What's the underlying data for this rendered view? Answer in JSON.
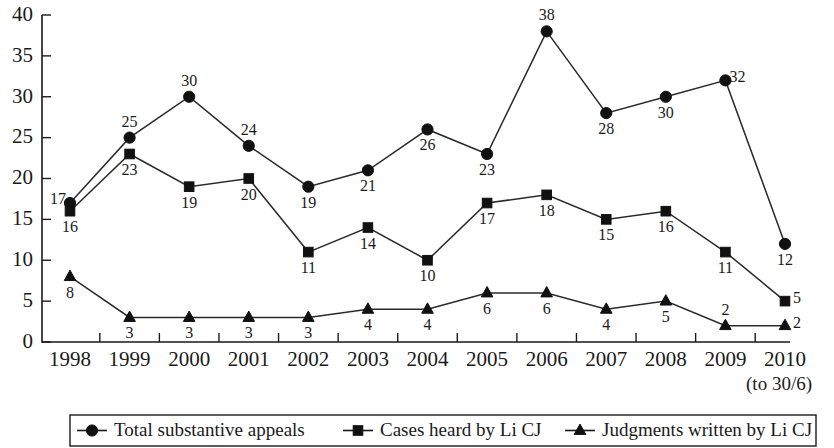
{
  "chart_data": {
    "type": "line",
    "title": "",
    "subtitle": "",
    "xlabel": "",
    "ylabel": "",
    "grid": false,
    "legend_position": "bottom",
    "ylim": [
      0,
      40
    ],
    "ytick_step": 5,
    "ytick_labels": [
      "0",
      "5",
      "10",
      "15",
      "20",
      "25",
      "30",
      "35",
      "40"
    ],
    "categories": [
      "1998",
      "1999",
      "2000",
      "2001",
      "2002",
      "2003",
      "2004",
      "2005",
      "2006",
      "2007",
      "2008",
      "2009",
      "2010"
    ],
    "series": [
      {
        "name": "Total substantive appeals",
        "marker": "circle",
        "values": [
          17,
          25,
          30,
          24,
          19,
          21,
          26,
          23,
          38,
          28,
          30,
          32,
          12
        ],
        "label_positions": [
          "left",
          "above",
          "above",
          "above",
          "below",
          "below",
          "below",
          "below",
          "above",
          "below",
          "below",
          "right",
          "below"
        ]
      },
      {
        "name": "Cases heard by Li CJ",
        "marker": "square",
        "values": [
          16,
          23,
          19,
          20,
          11,
          14,
          10,
          17,
          18,
          15,
          16,
          11,
          5
        ],
        "label_positions": [
          "below",
          "below",
          "below",
          "below",
          "below",
          "below",
          "below",
          "below",
          "below",
          "below",
          "below",
          "below",
          "right"
        ]
      },
      {
        "name": "Judgments written by Li CJ",
        "marker": "triangle",
        "values": [
          8,
          3,
          3,
          3,
          3,
          4,
          4,
          6,
          6,
          4,
          5,
          2,
          2
        ],
        "label_positions": [
          "below",
          "below",
          "below",
          "below",
          "below",
          "below",
          "below",
          "below",
          "below",
          "below",
          "below",
          "above",
          "right"
        ]
      }
    ],
    "annotations": [
      {
        "text": "(to 30/6)",
        "anchor": "below-axis-right"
      }
    ]
  },
  "legend": {
    "entries": [
      {
        "label": "Total substantive appeals",
        "marker": "circle-marker-icon"
      },
      {
        "label": "Cases heard by Li CJ",
        "marker": "square-marker-icon"
      },
      {
        "label": "Judgments written by Li CJ",
        "marker": "triangle-marker-icon"
      }
    ]
  },
  "colors": {
    "ink": "#1a1a1a",
    "marker": "#111111",
    "background": "#ffffff"
  }
}
